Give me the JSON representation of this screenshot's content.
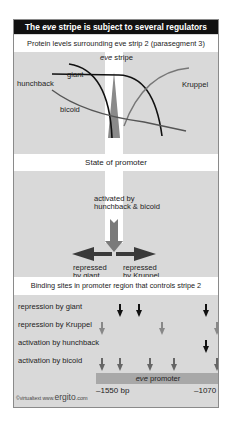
{
  "title": {
    "prefix": "The ",
    "italic": "eve",
    "suffix": " stripe is subject to several regulators"
  },
  "section1": {
    "heading": "Protein levels surrounding eve strip 2 (parasegment 3)",
    "stripe_label_italic": "eve",
    "stripe_label_rest": " stripe",
    "curves": {
      "giant": "giant",
      "hunchback": "hunchback",
      "kruppel": "Kruppel",
      "bicoid": "bicoid"
    }
  },
  "section2": {
    "heading": "State of promoter",
    "activated_line1": "activated by",
    "activated_line2": "hunchback & bicoid",
    "repressed_left_line1": "repressed",
    "repressed_left_line2": "by giant",
    "repressed_right_line1": "repressed",
    "repressed_right_line2": "by Kruppel"
  },
  "section3": {
    "heading": "Binding sites in promoter region that controls stripe 2",
    "rows": [
      {
        "label": "repression by giant",
        "color": "#111111",
        "x": [
          106,
          125,
          192
        ]
      },
      {
        "label": "repression by Kruppel",
        "color": "#888888",
        "x": [
          88,
          148,
          203
        ]
      },
      {
        "label": "activation by hunchback",
        "color": "#111111",
        "x": [
          192
        ]
      },
      {
        "label": "activation by bicoid",
        "color": "#666666",
        "x": [
          88,
          106,
          136,
          160,
          203
        ]
      }
    ],
    "promoter_italic": "eve",
    "promoter_rest": " promoter",
    "coord_left": "–1550 bp",
    "coord_right": "–1070"
  },
  "footer": {
    "copyright": "©virtualtext  www.",
    "brand": "ergito",
    "tld": ".com"
  },
  "colors": {
    "title_bg": "#111111",
    "panel_bg": "#d9d9d9",
    "band_bg": "#ffffff",
    "dark_arrow": "#333333",
    "gray_arrow": "#777777"
  }
}
